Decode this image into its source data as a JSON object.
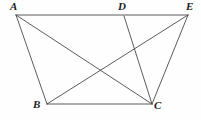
{
  "figure": {
    "type": "geometry-diagram",
    "title": "",
    "canvas": {
      "width": 201,
      "height": 120,
      "background": "#fefefe"
    },
    "stroke_color": "#4a4a4a",
    "label_color": "#1c1c1c",
    "vertices": [
      {
        "id": "A",
        "label": "A",
        "x": 16,
        "y": 15,
        "label_x": 10,
        "label_y": 1
      },
      {
        "id": "D",
        "label": "D",
        "x": 124,
        "y": 16,
        "label_x": 118,
        "label_y": 1
      },
      {
        "id": "E",
        "label": "E",
        "x": 188,
        "y": 15,
        "label_x": 186,
        "label_y": 1
      },
      {
        "id": "B",
        "label": "B",
        "x": 47,
        "y": 104,
        "label_x": 33,
        "label_y": 99
      },
      {
        "id": "C",
        "label": "C",
        "x": 152,
        "y": 104,
        "label_x": 154,
        "label_y": 100
      }
    ],
    "edges": [
      {
        "id": "AE",
        "from": "A",
        "to": "E",
        "name": "segment-ae"
      },
      {
        "id": "BC",
        "from": "B",
        "to": "C",
        "name": "segment-bc"
      },
      {
        "id": "AB",
        "from": "A",
        "to": "B",
        "name": "segment-ab"
      },
      {
        "id": "AC",
        "from": "A",
        "to": "C",
        "name": "segment-ac"
      },
      {
        "id": "BE",
        "from": "B",
        "to": "E",
        "name": "segment-be"
      },
      {
        "id": "DC",
        "from": "D",
        "to": "C",
        "name": "segment-dc"
      },
      {
        "id": "CE",
        "from": "C",
        "to": "E",
        "name": "segment-ce"
      }
    ]
  }
}
